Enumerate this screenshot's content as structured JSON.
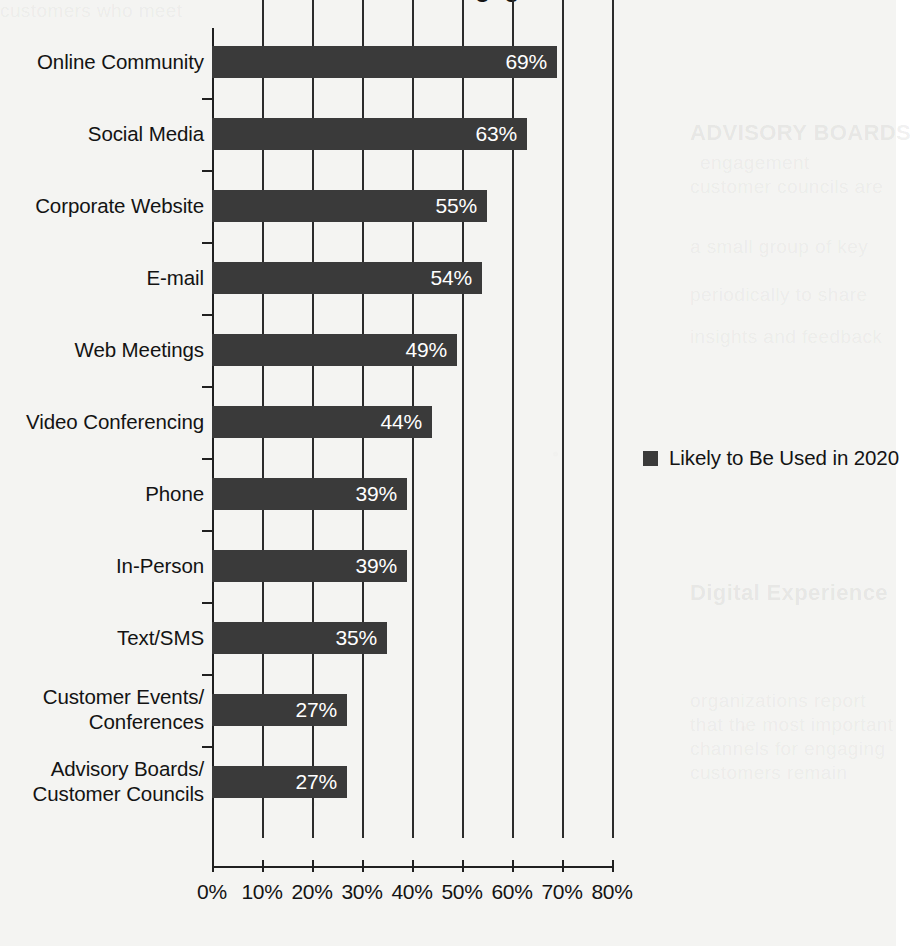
{
  "chart_data": {
    "type": "bar",
    "orientation": "horizontal",
    "title": "",
    "xlabel": "",
    "ylabel": "",
    "xlim": [
      0,
      80
    ],
    "xticks": [
      "0%",
      "10%",
      "20%",
      "30%",
      "40%",
      "50%",
      "60%",
      "70%",
      "80%"
    ],
    "xtick_values": [
      0,
      10,
      20,
      30,
      40,
      50,
      60,
      70,
      80
    ],
    "grid": "vertical",
    "legend_position": "right",
    "legend": [
      "Likely to Be Used in 2020"
    ],
    "categories": [
      "Online Community",
      "Social Media",
      "Corporate Website",
      "E-mail",
      "Web Meetings",
      "Video Conferencing",
      "Phone",
      "In-Person",
      "Text/SMS",
      "Customer Events/\nConferences",
      "Advisory Boards/\nCustomer Councils"
    ],
    "series": [
      {
        "name": "Likely to Be Used in 2020",
        "values": [
          69,
          63,
          55,
          54,
          49,
          44,
          39,
          39,
          35,
          27,
          27
        ],
        "labels": [
          "69%",
          "63%",
          "55%",
          "54%",
          "49%",
          "44%",
          "39%",
          "39%",
          "35%",
          "27%",
          "27%"
        ],
        "color": "#3a3a3a"
      }
    ]
  },
  "colors": {
    "bar": "#3a3a3a",
    "axis": "#202020",
    "grid": "#2b2b2b",
    "text": "#131313",
    "bar_label": "#ffffff",
    "paper": "#f4f4f2"
  },
  "legend": {
    "label": "Likely to Be Used in 2020"
  },
  "title_fragment": "Methods of Engagement"
}
